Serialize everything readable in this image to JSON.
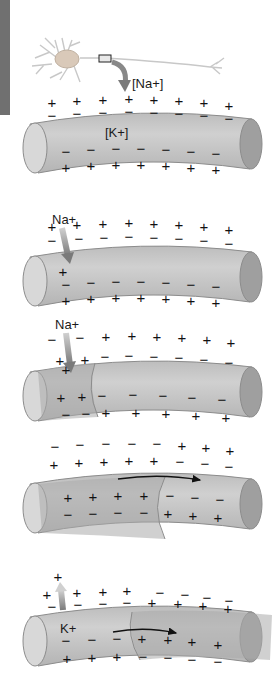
{
  "figure": {
    "colors": {
      "membrane_light": "#c9c9c9",
      "membrane_dark": "#a9a9a9",
      "depolarized": "#b3b3b3",
      "end_cap_left": "#d6d6d6",
      "end_cap_right": "#9d9d9d",
      "arrow_gray": "#8a8a8a",
      "side_tab": "#707070"
    },
    "panels": [
      {
        "id": "resting",
        "labels": {
          "neuron_ion": "[Na+]",
          "inner_ion": "[K+]"
        },
        "outside_top": [
          "+",
          "+",
          "+",
          "+",
          "+",
          "+",
          "+",
          "+"
        ],
        "inside_top": [
          "−",
          "−",
          "−",
          "−",
          "−",
          "−",
          "−",
          "−"
        ],
        "inside_bottom": [
          "−",
          "−",
          "−",
          "−",
          "−",
          "−",
          "−"
        ],
        "outside_bottom": [
          "+",
          "+",
          "+",
          "+",
          "+",
          "+",
          "+"
        ]
      },
      {
        "id": "na-influx",
        "labels": {
          "ion": "Na+"
        },
        "outside_top": [
          "+",
          "+",
          "+",
          "+",
          "+",
          "+",
          "+",
          "+"
        ],
        "inside_top": [
          "−",
          "−",
          "−",
          "−",
          "−",
          "−",
          "−"
        ],
        "inside_extra": [
          "+"
        ],
        "inside_bottom": [
          "−",
          "−",
          "−",
          "−",
          "−",
          "−",
          "−"
        ],
        "outside_bottom": [
          "+",
          "+",
          "+",
          "+",
          "+",
          "+",
          "+"
        ]
      },
      {
        "id": "depolarization",
        "labels": {
          "ion": "Na+"
        },
        "outside_top": [
          "−",
          "−",
          "+",
          "+",
          "+",
          "+",
          "+",
          "+"
        ],
        "inside_top": [
          "+",
          "+",
          "+",
          "−",
          "−",
          "−",
          "−",
          "−",
          "−"
        ],
        "inside_bottom": [
          "+",
          "+",
          "−",
          "−",
          "−",
          "−",
          "−"
        ],
        "outside_bottom": [
          "−",
          "−",
          "+",
          "+",
          "+",
          "+",
          "+"
        ]
      },
      {
        "id": "propagation",
        "labels": {},
        "outside_top": [
          "−",
          "−",
          "−",
          "−",
          "−",
          "+",
          "+",
          "+"
        ],
        "inside_top": [
          "+",
          "+",
          "+",
          "+",
          "+",
          "−",
          "−",
          "−"
        ],
        "inside_bottom": [
          "+",
          "+",
          "+",
          "+",
          "−",
          "−",
          "−"
        ],
        "outside_bottom": [
          "−",
          "−",
          "−",
          "−",
          "+",
          "+",
          "+"
        ]
      },
      {
        "id": "repolarization",
        "labels": {
          "ion": "K+"
        },
        "outside_top": [
          "+",
          "+",
          "+",
          "+",
          "+",
          "−",
          "−",
          "−",
          "−"
        ],
        "inside_top": [
          "−",
          "−",
          "−",
          "−",
          "+",
          "+",
          "+",
          "+"
        ],
        "inside_bottom": [
          "−",
          "−",
          "−",
          "+",
          "+",
          "+",
          "+"
        ],
        "outside_bottom": [
          "+",
          "+",
          "+",
          "−",
          "−",
          "−",
          "−"
        ]
      }
    ]
  }
}
